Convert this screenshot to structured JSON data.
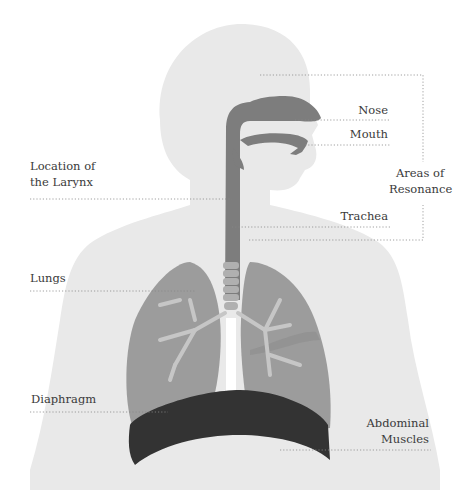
{
  "diagram": {
    "colors": {
      "body": "#e9e9e9",
      "airway": "#7d7d7d",
      "lung": "#9c9c9c",
      "lung_dark": "#8a8a8a",
      "bronchi": "#c6c6c6",
      "trachea_rings": "#b0b0b0",
      "diaphragm": "#333333",
      "leader": "#888888"
    },
    "labels": {
      "nose": "Nose",
      "mouth": "Mouth",
      "larynx_line1": "Location of",
      "larynx_line2": "the Larynx",
      "resonance_line1": "Areas of",
      "resonance_line2": "Resonance",
      "trachea": "Trachea",
      "lungs": "Lungs",
      "diaphragm": "Diaphragm",
      "abdominal_line1": "Abdominal",
      "abdominal_line2": "Muscles"
    }
  }
}
